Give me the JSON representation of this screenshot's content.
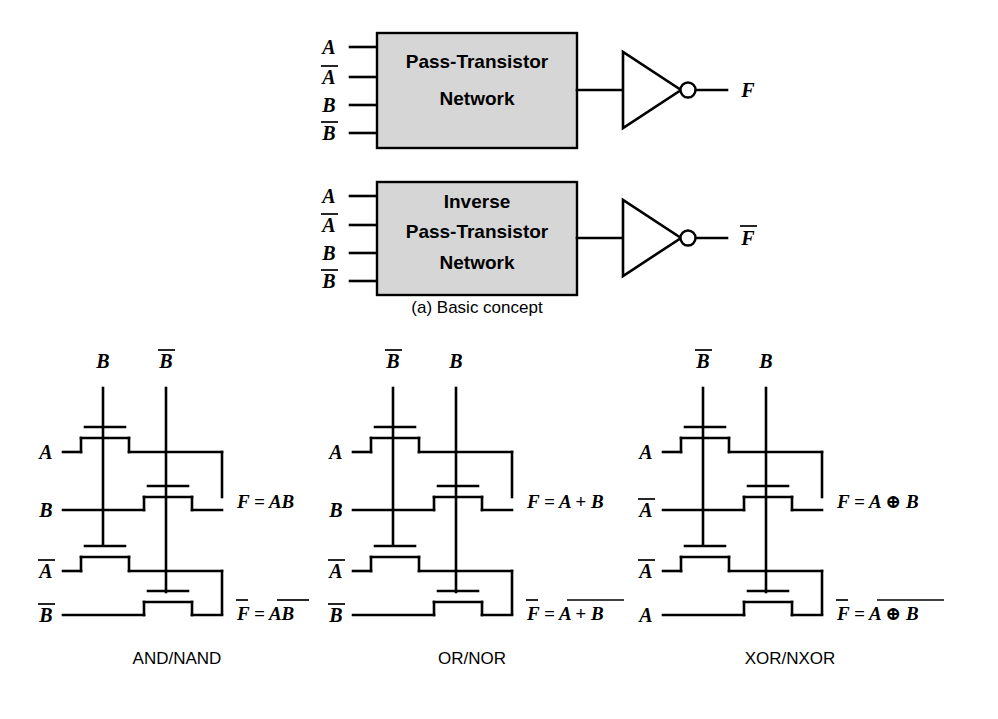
{
  "figure": {
    "caption_a": "(a) Basic concept"
  },
  "block_diagrams": [
    {
      "id": "pass-transistor-network",
      "box_lines": [
        "Pass-Transistor",
        "Network"
      ],
      "inputs": [
        {
          "label": "A",
          "overbar": false
        },
        {
          "label": "A",
          "overbar": true
        },
        {
          "label": "B",
          "overbar": false
        },
        {
          "label": "B",
          "overbar": true
        }
      ],
      "output": {
        "label": "F",
        "overbar": false
      },
      "inverter": "inverter-gate"
    },
    {
      "id": "inverse-pass-transistor-network",
      "box_lines": [
        "Inverse",
        "Pass-Transistor",
        "Network"
      ],
      "inputs": [
        {
          "label": "A",
          "overbar": false
        },
        {
          "label": "A",
          "overbar": true
        },
        {
          "label": "B",
          "overbar": false
        },
        {
          "label": "B",
          "overbar": true
        }
      ],
      "output": {
        "label": "F",
        "overbar": true
      },
      "inverter": "inverter-gate"
    }
  ],
  "circuits": [
    {
      "id": "and-nand",
      "name": "AND/NAND",
      "top_rails": [
        {
          "label": "B",
          "overbar": false
        },
        {
          "label": "B",
          "overbar": true
        }
      ],
      "gate_inputs": [
        {
          "label": "A",
          "overbar": false
        },
        {
          "label": "B",
          "overbar": false
        },
        {
          "label": "A",
          "overbar": true
        },
        {
          "label": "B",
          "overbar": true
        }
      ],
      "outputs": [
        {
          "lhs": "F",
          "lhs_overbar": false,
          "rhs": "AB",
          "rhs_overbar": false,
          "text": "F = AB"
        },
        {
          "lhs": "F",
          "lhs_overbar": true,
          "rhs": "AB",
          "rhs_overbar": true,
          "text": "F = AB"
        }
      ]
    },
    {
      "id": "or-nor",
      "name": "OR/NOR",
      "top_rails": [
        {
          "label": "B",
          "overbar": true
        },
        {
          "label": "B",
          "overbar": false
        }
      ],
      "gate_inputs": [
        {
          "label": "A",
          "overbar": false
        },
        {
          "label": "B",
          "overbar": false
        },
        {
          "label": "A",
          "overbar": true
        },
        {
          "label": "B",
          "overbar": true
        }
      ],
      "outputs": [
        {
          "lhs": "F",
          "lhs_overbar": false,
          "rhs": "A + B",
          "rhs_overbar": false,
          "text": "F = A + B"
        },
        {
          "lhs": "F",
          "lhs_overbar": true,
          "rhs": "A + B",
          "rhs_overbar": true,
          "text": "F = A + B"
        }
      ]
    },
    {
      "id": "xor-nxor",
      "name": "XOR/NXOR",
      "top_rails": [
        {
          "label": "B",
          "overbar": true
        },
        {
          "label": "B",
          "overbar": false
        }
      ],
      "gate_inputs": [
        {
          "label": "A",
          "overbar": false
        },
        {
          "label": "A",
          "overbar": true
        },
        {
          "label": "A",
          "overbar": true
        },
        {
          "label": "A",
          "overbar": false
        }
      ],
      "outputs": [
        {
          "lhs": "F",
          "lhs_overbar": false,
          "rhs": "A ⊕ B",
          "rhs_overbar": false,
          "text": "F = A ⊕ B"
        },
        {
          "lhs": "F",
          "lhs_overbar": true,
          "rhs": "A ⊕ B",
          "rhs_overbar": true,
          "text": "F = A ⊕ B"
        }
      ]
    }
  ],
  "colors": {
    "box_fill": "#d6d6d6",
    "line": "#000000",
    "background": "#ffffff"
  }
}
